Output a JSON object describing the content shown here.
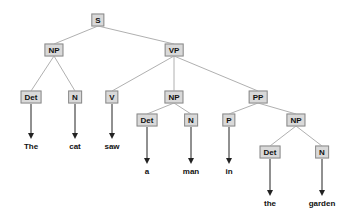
{
  "diagram": {
    "type": "parse-tree",
    "sentence": "The cat saw a man in the garden",
    "nodes": [
      {
        "id": "S",
        "label": "S",
        "x": 98,
        "y": 20
      },
      {
        "id": "NP1",
        "label": "NP",
        "x": 54,
        "y": 50
      },
      {
        "id": "VP",
        "label": "VP",
        "x": 174,
        "y": 50
      },
      {
        "id": "Det1",
        "label": "Det",
        "x": 31,
        "y": 97
      },
      {
        "id": "N1",
        "label": "N",
        "x": 75,
        "y": 97
      },
      {
        "id": "V",
        "label": "V",
        "x": 112,
        "y": 97
      },
      {
        "id": "NP2",
        "label": "NP",
        "x": 174,
        "y": 97
      },
      {
        "id": "PP",
        "label": "PP",
        "x": 258,
        "y": 97
      },
      {
        "id": "Det2",
        "label": "Det",
        "x": 147,
        "y": 120
      },
      {
        "id": "N2",
        "label": "N",
        "x": 191,
        "y": 120
      },
      {
        "id": "P",
        "label": "P",
        "x": 229,
        "y": 120
      },
      {
        "id": "NP3",
        "label": "NP",
        "x": 296,
        "y": 120
      },
      {
        "id": "Det3",
        "label": "Det",
        "x": 270,
        "y": 152
      },
      {
        "id": "N3",
        "label": "N",
        "x": 322,
        "y": 152
      }
    ],
    "words": [
      {
        "label": "The",
        "x": 31,
        "y": 146,
        "parent": "Det1"
      },
      {
        "label": "cat",
        "x": 75,
        "y": 146,
        "parent": "N1"
      },
      {
        "label": "saw",
        "x": 112,
        "y": 146,
        "parent": "V"
      },
      {
        "label": "a",
        "x": 147,
        "y": 171,
        "parent": "Det2"
      },
      {
        "label": "man",
        "x": 191,
        "y": 171,
        "parent": "N2"
      },
      {
        "label": "in",
        "x": 229,
        "y": 171,
        "parent": "P"
      },
      {
        "label": "the",
        "x": 270,
        "y": 203,
        "parent": "Det3"
      },
      {
        "label": "garden",
        "x": 322,
        "y": 203,
        "parent": "N3"
      }
    ],
    "edges": [
      [
        "S",
        "NP1"
      ],
      [
        "S",
        "VP"
      ],
      [
        "NP1",
        "Det1"
      ],
      [
        "NP1",
        "N1"
      ],
      [
        "VP",
        "V"
      ],
      [
        "VP",
        "NP2"
      ],
      [
        "VP",
        "PP"
      ],
      [
        "NP2",
        "Det2"
      ],
      [
        "NP2",
        "N2"
      ],
      [
        "PP",
        "P"
      ],
      [
        "PP",
        "NP3"
      ],
      [
        "NP3",
        "Det3"
      ],
      [
        "NP3",
        "N3"
      ]
    ],
    "colors": {
      "node_fill": "#d9d9d9",
      "node_border": "#8a8a8a",
      "edge": "#b0b0b0",
      "arrow": "#222222",
      "text": "#111111"
    }
  }
}
